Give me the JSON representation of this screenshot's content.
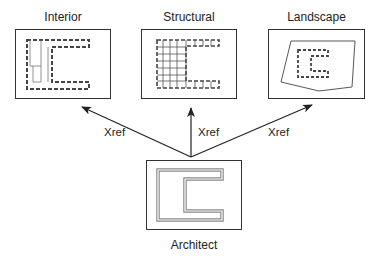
{
  "diagram": {
    "nodes": [
      {
        "id": "interior",
        "label": "Interior"
      },
      {
        "id": "structural",
        "label": "Structural"
      },
      {
        "id": "landscape",
        "label": "Landscape"
      },
      {
        "id": "architect",
        "label": "Architect"
      }
    ],
    "edges": [
      {
        "from": "architect",
        "to": "interior",
        "label": "Xref"
      },
      {
        "from": "architect",
        "to": "structural",
        "label": "Xref"
      },
      {
        "from": "architect",
        "to": "landscape",
        "label": "Xref"
      }
    ],
    "colors": {
      "line": "#222222",
      "plan_outline": "#888888",
      "background": "#ffffff"
    }
  }
}
